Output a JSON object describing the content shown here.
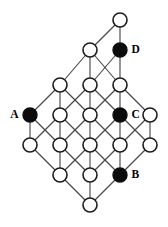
{
  "figure": {
    "kind": "hasse-lattice-graph",
    "width": 168,
    "height": 227,
    "background_color": "#ffffff",
    "node_radius": 7.0,
    "node_open_fill": "#ffffff",
    "node_open_stroke": "#1c1c1c",
    "node_filled_fill": "#0c0c0c",
    "edge_color": "#4a4a4a",
    "edge_width": 1.15,
    "label_color": "#000000"
  },
  "labels": {
    "a": "A",
    "b": "B",
    "c": "C",
    "d": "D"
  },
  "chart_data": {
    "type": "diagram",
    "node_count": 21,
    "filled_node_count": 4,
    "edge_count": 40,
    "rows": [
      {
        "row": 0,
        "y": 20,
        "count": 1,
        "xs": [
          120
        ]
      },
      {
        "row": 1,
        "y": 50,
        "count": 2,
        "xs": [
          90,
          120
        ]
      },
      {
        "row": 2,
        "y": 85,
        "count": 3,
        "xs": [
          60,
          90,
          120
        ]
      },
      {
        "row": 3,
        "y": 115,
        "count": 5,
        "xs": [
          30,
          60,
          90,
          120,
          150
        ]
      },
      {
        "row": 4,
        "y": 145,
        "count": 5,
        "xs": [
          30,
          60,
          90,
          120,
          150
        ]
      },
      {
        "row": 5,
        "y": 175,
        "count": 3,
        "xs": [
          60,
          90,
          120
        ]
      },
      {
        "row": 6,
        "y": 205,
        "count": 1,
        "xs": [
          90
        ]
      }
    ],
    "nodes": [
      {
        "id": "n0",
        "x": 120,
        "y": 20,
        "filled": false,
        "label": null
      },
      {
        "id": "n1",
        "x": 90,
        "y": 50,
        "filled": false,
        "label": null
      },
      {
        "id": "n2",
        "x": 120,
        "y": 50,
        "filled": true,
        "label": "D",
        "label_side": "right"
      },
      {
        "id": "n3",
        "x": 60,
        "y": 85,
        "filled": false,
        "label": null
      },
      {
        "id": "n4",
        "x": 90,
        "y": 85,
        "filled": false,
        "label": null
      },
      {
        "id": "n5",
        "x": 120,
        "y": 85,
        "filled": false,
        "label": null
      },
      {
        "id": "n6",
        "x": 30,
        "y": 115,
        "filled": true,
        "label": "A",
        "label_side": "left"
      },
      {
        "id": "n7",
        "x": 60,
        "y": 115,
        "filled": false,
        "label": null
      },
      {
        "id": "n8",
        "x": 90,
        "y": 115,
        "filled": false,
        "label": null
      },
      {
        "id": "n9",
        "x": 120,
        "y": 115,
        "filled": true,
        "label": "C",
        "label_side": "right"
      },
      {
        "id": "n10",
        "x": 150,
        "y": 115,
        "filled": false,
        "label": null
      },
      {
        "id": "n11",
        "x": 30,
        "y": 145,
        "filled": false,
        "label": null
      },
      {
        "id": "n12",
        "x": 60,
        "y": 145,
        "filled": false,
        "label": null
      },
      {
        "id": "n13",
        "x": 90,
        "y": 145,
        "filled": false,
        "label": null
      },
      {
        "id": "n14",
        "x": 120,
        "y": 145,
        "filled": false,
        "label": null
      },
      {
        "id": "n15",
        "x": 150,
        "y": 145,
        "filled": false,
        "label": null
      },
      {
        "id": "n16",
        "x": 60,
        "y": 175,
        "filled": false,
        "label": null
      },
      {
        "id": "n17",
        "x": 90,
        "y": 175,
        "filled": false,
        "label": null
      },
      {
        "id": "n18",
        "x": 120,
        "y": 175,
        "filled": true,
        "label": "B",
        "label_side": "right"
      },
      {
        "id": "n19",
        "x": 90,
        "y": 205,
        "filled": false,
        "label": null
      }
    ],
    "edges": [
      [
        "n0",
        "n1"
      ],
      [
        "n0",
        "n2"
      ],
      [
        "n1",
        "n3"
      ],
      [
        "n1",
        "n4"
      ],
      [
        "n1",
        "n5"
      ],
      [
        "n2",
        "n4"
      ],
      [
        "n2",
        "n5"
      ],
      [
        "n3",
        "n6"
      ],
      [
        "n3",
        "n7"
      ],
      [
        "n3",
        "n8"
      ],
      [
        "n4",
        "n7"
      ],
      [
        "n4",
        "n8"
      ],
      [
        "n4",
        "n9"
      ],
      [
        "n5",
        "n8"
      ],
      [
        "n5",
        "n9"
      ],
      [
        "n5",
        "n10"
      ],
      [
        "n6",
        "n11"
      ],
      [
        "n6",
        "n12"
      ],
      [
        "n7",
        "n11"
      ],
      [
        "n7",
        "n12"
      ],
      [
        "n7",
        "n13"
      ],
      [
        "n8",
        "n12"
      ],
      [
        "n8",
        "n13"
      ],
      [
        "n8",
        "n14"
      ],
      [
        "n9",
        "n13"
      ],
      [
        "n9",
        "n14"
      ],
      [
        "n9",
        "n15"
      ],
      [
        "n10",
        "n14"
      ],
      [
        "n10",
        "n15"
      ],
      [
        "n11",
        "n16"
      ],
      [
        "n12",
        "n16"
      ],
      [
        "n12",
        "n17"
      ],
      [
        "n13",
        "n16"
      ],
      [
        "n13",
        "n17"
      ],
      [
        "n13",
        "n18"
      ],
      [
        "n14",
        "n17"
      ],
      [
        "n14",
        "n18"
      ],
      [
        "n15",
        "n18"
      ],
      [
        "n16",
        "n19"
      ],
      [
        "n17",
        "n19"
      ],
      [
        "n18",
        "n19"
      ]
    ]
  }
}
